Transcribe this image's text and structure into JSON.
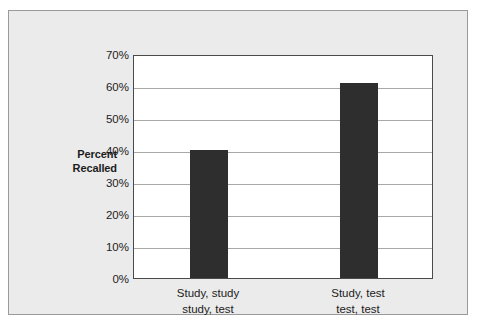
{
  "chart_data": {
    "type": "bar",
    "title": "",
    "subtitle": "",
    "xlabel": "",
    "ylabel": "Percent\nRecalled",
    "ylabel_lines": [
      "Percent",
      "Recalled"
    ],
    "categories": [
      "Study, study\nstudy, test",
      "Study, test\ntest, test"
    ],
    "category_lines": [
      [
        "Study, study",
        "study, test"
      ],
      [
        "Study, test",
        "test, test"
      ]
    ],
    "values": [
      40,
      61
    ],
    "value_labels": [
      "40%",
      "61%"
    ],
    "ylim": [
      0,
      70
    ],
    "ytick_values": [
      0,
      10,
      20,
      30,
      40,
      50,
      60,
      70
    ],
    "ytick_labels": [
      "0%",
      "10%",
      "20%",
      "30%",
      "40%",
      "50%",
      "60%",
      "70%"
    ],
    "grid": true,
    "grid_axis": "y",
    "legend": false,
    "legend_position": "none",
    "bar_color": "#2e2e2e",
    "plot_background": "#ffffff",
    "figure_background": "#ebebeb",
    "axis_color": "#4a4a4a",
    "gridline_color": "#a8a8a8",
    "text_color": "#1c1c1c"
  }
}
